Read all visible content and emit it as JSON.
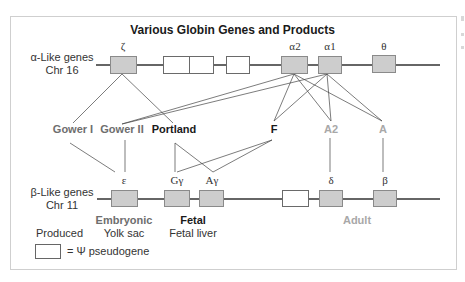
{
  "title": "Various Globin Genes and Products",
  "colors": {
    "gene_fill": "#cdcdcd",
    "pseudogene_fill": "#ffffff",
    "line": "#333333",
    "embryonic_text": "#6e6e6e",
    "fetal_text": "#1a1a1a",
    "adult_text": "#a8a8a8"
  },
  "alpha_cluster": {
    "label_line1": "α-Like genes",
    "label_line2": "Chr 16",
    "genes": [
      {
        "name": "ζ",
        "type": "functional"
      },
      {
        "name": "",
        "type": "pseudogene"
      },
      {
        "name": "",
        "type": "pseudogene"
      },
      {
        "name": "",
        "type": "pseudogene"
      },
      {
        "name": "α2",
        "type": "functional"
      },
      {
        "name": "α1",
        "type": "functional"
      },
      {
        "name": "θ",
        "type": "functional"
      }
    ]
  },
  "beta_cluster": {
    "label_line1": "β-Like genes",
    "label_line2": "Chr 11",
    "genes": [
      {
        "name": "ε",
        "type": "functional"
      },
      {
        "name": "Gγ",
        "type": "functional"
      },
      {
        "name": "Aγ",
        "type": "functional"
      },
      {
        "name": "",
        "type": "pseudogene"
      },
      {
        "name": "δ",
        "type": "functional"
      },
      {
        "name": "β",
        "type": "functional"
      }
    ]
  },
  "products": [
    {
      "name": "Gower I",
      "stage": "embryonic",
      "alpha_chain": "ζ",
      "beta_chain": "ε"
    },
    {
      "name": "Gower II",
      "stage": "embryonic",
      "alpha_chain": "α2/α1",
      "beta_chain": "ε"
    },
    {
      "name": "Portland",
      "stage": "fetal",
      "alpha_chain": "ζ",
      "beta_chain": "Gγ/Aγ"
    },
    {
      "name": "F",
      "stage": "fetal",
      "alpha_chain": "α2/α1",
      "beta_chain": "Gγ/Aγ"
    },
    {
      "name": "A2",
      "stage": "adult",
      "alpha_chain": "α2/α1",
      "beta_chain": "δ"
    },
    {
      "name": "A",
      "stage": "adult",
      "alpha_chain": "α2/α1",
      "beta_chain": "β"
    }
  ],
  "stages": {
    "produced_label": "Produced",
    "embryonic": {
      "title": "Embryonic",
      "site": "Yolk sac"
    },
    "fetal": {
      "title": "Fetal",
      "site": "Fetal liver"
    },
    "adult": {
      "title": "Adult"
    }
  },
  "legend": {
    "text": "= Ψ pseudogene"
  }
}
